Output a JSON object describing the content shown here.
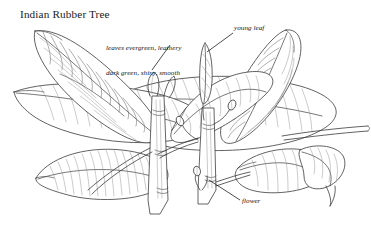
{
  "figure": {
    "title": "Indian Rubber Tree",
    "style": "pen-and-ink botanical line drawing",
    "background_color": "#ffffff",
    "ink_color": "#333333",
    "vein_color": "#777777"
  },
  "annotations": {
    "leaves": {
      "line1": "leaves evergreen, leathery",
      "line2": "dark green, shiny, smooth"
    },
    "young_leaf": "young leaf",
    "flower": "flower"
  },
  "parts": [
    {
      "name": "upper-left-leaf"
    },
    {
      "name": "left-leaf"
    },
    {
      "name": "center-large-leaf"
    },
    {
      "name": "lower-left-leaf"
    },
    {
      "name": "center-stem"
    },
    {
      "name": "right-stem"
    },
    {
      "name": "young-leaf-spike"
    },
    {
      "name": "upper-right-leaf"
    },
    {
      "name": "lower-right-leaf"
    },
    {
      "name": "right-petiole"
    },
    {
      "name": "flower-buds"
    }
  ]
}
